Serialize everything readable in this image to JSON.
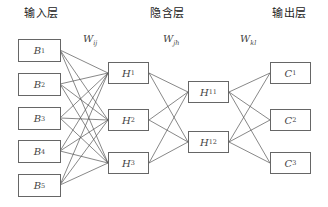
{
  "layers": {
    "input_title": "输入层",
    "hidden_title": "隐含层",
    "output_title": "输出层"
  },
  "weights": [
    {
      "symbol": "W",
      "sub": "ij"
    },
    {
      "symbol": "W",
      "sub": "jh"
    },
    {
      "symbol": "W",
      "sub": "kl"
    }
  ],
  "nodes": {
    "input": [
      {
        "symbol": "B",
        "sub": "1"
      },
      {
        "symbol": "B",
        "sub": "2"
      },
      {
        "symbol": "B",
        "sub": "3"
      },
      {
        "symbol": "B",
        "sub": "4"
      },
      {
        "symbol": "B",
        "sub": "5"
      }
    ],
    "hidden1": [
      {
        "symbol": "H",
        "sub": "1"
      },
      {
        "symbol": "H",
        "sub": "2"
      },
      {
        "symbol": "H",
        "sub": "3"
      }
    ],
    "hidden2": [
      {
        "symbol": "H",
        "sub": "11"
      },
      {
        "symbol": "H",
        "sub": "12"
      }
    ],
    "output": [
      {
        "symbol": "C",
        "sub": "1"
      },
      {
        "symbol": "C",
        "sub": "2"
      },
      {
        "symbol": "C",
        "sub": "3"
      }
    ]
  },
  "colors": {
    "line": "#555555",
    "border": "#666666"
  }
}
